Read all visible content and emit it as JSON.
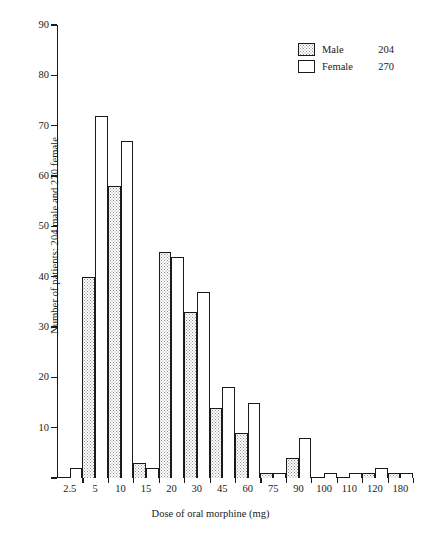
{
  "chart_data": {
    "type": "bar",
    "title": "",
    "xlabel": "Dose of oral morphine (mg)",
    "ylabel": "Number of patients: 204 male and 270 female",
    "categories": [
      "2.5",
      "5",
      "10",
      "15",
      "20",
      "30",
      "45",
      "60",
      "75",
      "90",
      "100",
      "110",
      "120",
      "180"
    ],
    "series": [
      {
        "name": "Male",
        "total": 204,
        "swatch": "dotted",
        "values": [
          0,
          40,
          58,
          3,
          45,
          33,
          14,
          9,
          1,
          4,
          0,
          0,
          1,
          1
        ]
      },
      {
        "name": "Female",
        "total": 270,
        "swatch": "white",
        "values": [
          2,
          72,
          67,
          2,
          44,
          37,
          18,
          15,
          1,
          8,
          1,
          1,
          2,
          1
        ]
      }
    ],
    "ylim": [
      0,
      90
    ],
    "yticks": [
      0,
      10,
      20,
      30,
      40,
      50,
      60,
      70,
      80,
      90
    ],
    "ytick_labels": [
      "",
      "10",
      "20",
      "30",
      "40",
      "50",
      "60",
      "70",
      "80",
      "90"
    ],
    "grid": false,
    "legend_position": "top-right",
    "axis_color": "#1a1a1a",
    "bar_fill_male": "#e8e8e8",
    "bar_fill_female": "#ffffff"
  },
  "legend": {
    "entries": [
      {
        "label": "Male",
        "value": "204"
      },
      {
        "label": "Female",
        "value": "270"
      }
    ]
  }
}
